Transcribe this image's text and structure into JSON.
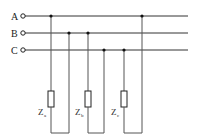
{
  "diagram": {
    "type": "circuit",
    "phases": [
      {
        "label": "A",
        "y": 16
      },
      {
        "label": "B",
        "y": 33
      },
      {
        "label": "C",
        "y": 50
      }
    ],
    "impedances": [
      {
        "symbol": "Z",
        "subscript": "a",
        "connects": [
          "A",
          "B"
        ]
      },
      {
        "symbol": "Z",
        "subscript": "b",
        "connects": [
          "B",
          "C"
        ]
      },
      {
        "symbol": "Z",
        "subscript": "c",
        "connects": [
          "C",
          "A"
        ]
      }
    ],
    "colors": {
      "wire": "#333333",
      "background": "#ffffff"
    }
  }
}
